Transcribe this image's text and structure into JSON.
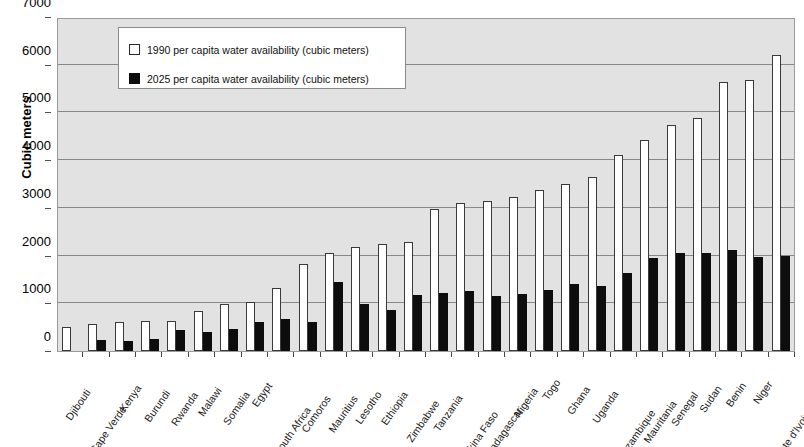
{
  "chart_data": {
    "type": "bar",
    "title": "",
    "xlabel": "",
    "ylabel": "Cubic meters",
    "ylim": [
      0,
      7000
    ],
    "ytick_values": [
      0,
      1000,
      2000,
      3000,
      4000,
      5000,
      6000,
      7000
    ],
    "ytick_labels": [
      "0",
      "1000",
      "2000",
      "3000",
      "4000",
      "5000",
      "6000",
      "7000"
    ],
    "grid": true,
    "legend_position": "upper-left-inside",
    "categories": [
      "Djibouti",
      "Cape Verde",
      "Kenya",
      "Burundi",
      "Rwanda",
      "Malawi",
      "Somalia",
      "Egypt",
      "South Africa",
      "Comoros",
      "Mauritius",
      "Lesotho",
      "Ethiopia",
      "Zimbabwe",
      "Tanzania",
      "Burkina Faso",
      "Madagascar",
      "Nigeria",
      "Togo",
      "Ghana",
      "Uganda",
      "Mozambique",
      "Mauritania",
      "Senegal",
      "Sudan",
      "Benin",
      "Niger",
      "Cote d'Ivoire"
    ],
    "series": [
      {
        "name": "1990 per capita water availability (cubic meters)",
        "color": "#ffffff",
        "values": [
          500,
          560,
          600,
          620,
          630,
          840,
          980,
          1030,
          1320,
          1820,
          2060,
          2190,
          2250,
          2290,
          2970,
          3100,
          3140,
          3220,
          3380,
          3510,
          3650,
          4110,
          4430,
          4740,
          4880,
          5630,
          5680,
          6200
        ]
      },
      {
        "name": "2025 per capita water availability (cubic meters)",
        "color": "#0d0d0d",
        "values": [
          0,
          230,
          200,
          260,
          440,
          400,
          470,
          600,
          670,
          610,
          1450,
          980,
          860,
          1170,
          1220,
          1250,
          1150,
          1190,
          1270,
          1400,
          1370,
          1630,
          1950,
          2050,
          2050,
          2120,
          1980,
          2000
        ]
      }
    ]
  },
  "legend": {
    "items": [
      {
        "swatch": "white",
        "label": "1990 per capita water availability (cubic meters)"
      },
      {
        "swatch": "black",
        "label": "2025 per capita water availability (cubic meters)"
      }
    ]
  }
}
